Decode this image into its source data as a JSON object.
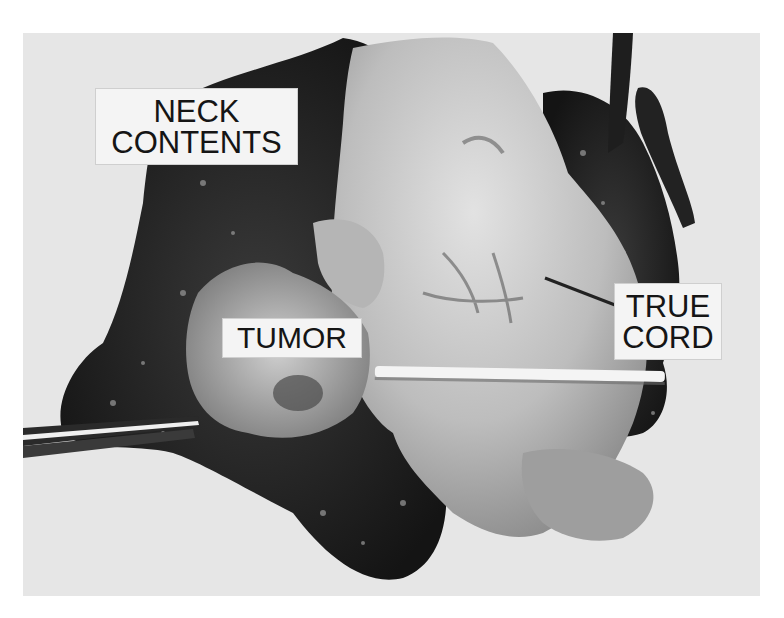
{
  "image": {
    "type": "black-and-white clinical specimen photograph",
    "subject": "excised larynx with neck contents",
    "background_color": "#e6e6e6",
    "page_background": "#ffffff"
  },
  "labels": {
    "neck_contents": {
      "line1": "NECK",
      "line2": "CONTENTS"
    },
    "tumor": {
      "line1": "TUMOR"
    },
    "true_cord": {
      "line1": "TRUE",
      "line2": "CORD"
    }
  },
  "annotations": {
    "probe": "horizontal white probe across glottis",
    "forceps": "forceps entering from left edge",
    "pointer": "line from TRUE CORD label to vocal cord"
  }
}
